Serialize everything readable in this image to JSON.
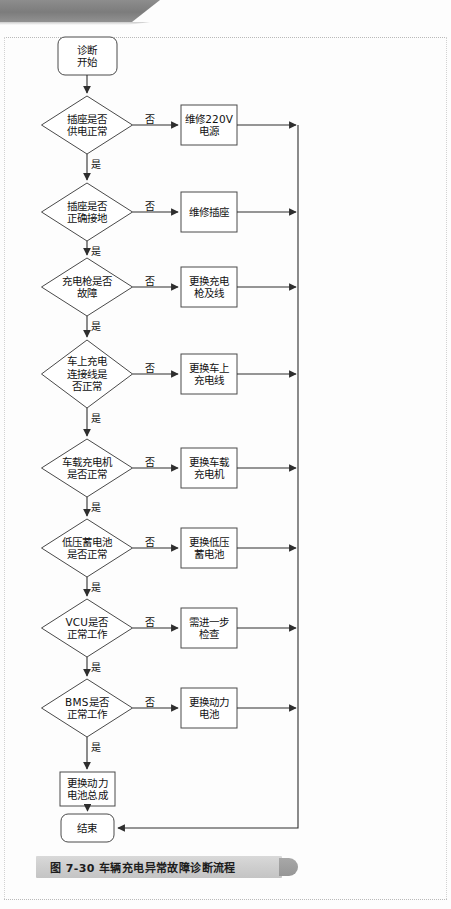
{
  "figure": {
    "caption_number": "图 7-30",
    "caption_title": "车辆充电异常故障诊断流程",
    "caption_full": "图 7-30   车辆充电异常故障诊断流程"
  },
  "labels": {
    "yes": "是",
    "no": "否"
  },
  "chart_data": {
    "type": "diagram",
    "title": "车辆充电异常故障诊断流程",
    "orientation": "top-to-bottom",
    "start_node": "诊断\n开始",
    "end_node": "结束",
    "terminal_action": "更换动力\n电池总成",
    "branch_label_yes": "是",
    "branch_label_no": "否",
    "steps": [
      {
        "decision": "插座是否\n供电正常",
        "no_action": "维修220V\n电源"
      },
      {
        "decision": "插座是否\n正确接地",
        "no_action": "维修插座"
      },
      {
        "decision": "充电枪是否\n故障",
        "no_action": "更换充电\n枪及线"
      },
      {
        "decision": "车上充电\n连接线是\n否正常",
        "no_action": "更换车上\n充电线"
      },
      {
        "decision": "车载充电机\n是否正常",
        "no_action": "更换车载\n充电机"
      },
      {
        "decision": "低压蓄电池\n是否正常",
        "no_action": "更换低压\n蓄电池"
      },
      {
        "decision": "VCU是否\n正常工作",
        "no_action": "需进一步\n检查"
      },
      {
        "decision": "BMS是否\n正常工作",
        "no_action": "更换动力\n电池"
      }
    ]
  },
  "colors": {
    "stroke": "#4a4a4a",
    "fill": "#ffffff",
    "band": "#8d8d8d",
    "caption_plate": "#d2d2d2",
    "text": "#111111"
  }
}
